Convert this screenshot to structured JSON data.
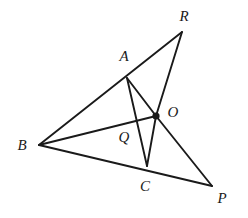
{
  "figure": {
    "type": "geometry-diagram",
    "background_color": "#ffffff",
    "stroke_color": "#1a1a1a",
    "label_color": "#1a1a1a",
    "width": 248,
    "height": 218
  },
  "points": {
    "A": {
      "label": "A",
      "x": 127,
      "y": 78,
      "label_x": 124,
      "label_y": 56,
      "marked": false
    },
    "B": {
      "label": "B",
      "x": 39,
      "y": 145,
      "label_x": 22,
      "label_y": 145,
      "marked": false
    },
    "C": {
      "label": "C",
      "x": 147,
      "y": 166,
      "label_x": 145,
      "label_y": 186,
      "marked": false
    },
    "O": {
      "label": "O",
      "x": 156,
      "y": 116,
      "label_x": 173,
      "label_y": 112,
      "marked": true
    },
    "P": {
      "label": "P",
      "x": 212,
      "y": 186,
      "label_x": 222,
      "label_y": 198,
      "marked": false
    },
    "Q": {
      "label": "Q",
      "x": 133,
      "y": 130,
      "label_x": 124,
      "label_y": 137,
      "marked": false
    },
    "R": {
      "label": "R",
      "x": 182,
      "y": 32,
      "label_x": 184,
      "label_y": 16,
      "marked": false
    }
  },
  "segments": [
    {
      "name": "segment-B-R-through-A",
      "from": "B",
      "to": "R",
      "stroke_width": 1.9
    },
    {
      "name": "segment-B-P-through-C",
      "from": "B",
      "to": "P",
      "stroke_width": 1.9
    },
    {
      "name": "segment-B-O",
      "from": "B",
      "to": "O",
      "stroke_width": 1.9
    },
    {
      "name": "segment-A-O",
      "from": "A",
      "to": "O",
      "stroke_width": 1.9
    },
    {
      "name": "segment-A-C",
      "from": "A",
      "to": "C",
      "stroke_width": 1.9
    },
    {
      "name": "segment-C-O",
      "from": "C",
      "to": "O",
      "stroke_width": 1.9
    },
    {
      "name": "segment-R-O",
      "from": "R",
      "to": "O",
      "stroke_width": 1.9
    },
    {
      "name": "segment-O-P",
      "from": "O",
      "to": "P",
      "stroke_width": 1.9
    }
  ],
  "point_marker": {
    "name": "point-O-dot",
    "radius": 3.6
  }
}
